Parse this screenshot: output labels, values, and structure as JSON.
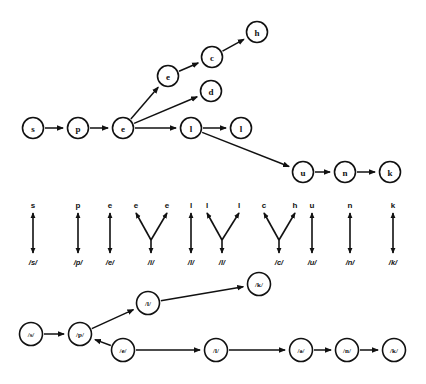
{
  "figure": {
    "background_color": "#ffffff",
    "ink_color": "#111111"
  },
  "letter_graph": {
    "name": "letter-lattice",
    "nodes": [
      {
        "id": "s1",
        "label": "s",
        "x": 33,
        "y": 128
      },
      {
        "id": "p1",
        "label": "p",
        "x": 78,
        "y": 128
      },
      {
        "id": "e1",
        "label": "e",
        "x": 123,
        "y": 128
      },
      {
        "id": "e2",
        "label": "e",
        "x": 168,
        "y": 76
      },
      {
        "id": "c1",
        "label": "c",
        "x": 212,
        "y": 57
      },
      {
        "id": "h1",
        "label": "h",
        "x": 257,
        "y": 32
      },
      {
        "id": "d1",
        "label": "d",
        "x": 211,
        "y": 91
      },
      {
        "id": "l1",
        "label": "l",
        "x": 191,
        "y": 128
      },
      {
        "id": "l2",
        "label": "l",
        "x": 241,
        "y": 128
      },
      {
        "id": "u1",
        "label": "u",
        "x": 303,
        "y": 172
      },
      {
        "id": "n1",
        "label": "n",
        "x": 345,
        "y": 172
      },
      {
        "id": "k1",
        "label": "k",
        "x": 390,
        "y": 172
      }
    ],
    "edges": [
      {
        "from": "s1",
        "to": "p1"
      },
      {
        "from": "p1",
        "to": "e1"
      },
      {
        "from": "e1",
        "to": "e2"
      },
      {
        "from": "e2",
        "to": "c1"
      },
      {
        "from": "c1",
        "to": "h1"
      },
      {
        "from": "e1",
        "to": "d1"
      },
      {
        "from": "e1",
        "to": "l1"
      },
      {
        "from": "l1",
        "to": "l2"
      },
      {
        "from": "l1",
        "to": "u1"
      },
      {
        "from": "u1",
        "to": "n1"
      },
      {
        "from": "n1",
        "to": "k1"
      }
    ]
  },
  "alignment": {
    "name": "grapheme-phoneme-alignment",
    "top_row_y": 205,
    "bottom_row_y": 262,
    "groups": [
      {
        "phoneme": "/s/",
        "phoneme_x": 33,
        "letters": [
          {
            "label": "s",
            "x": 33
          }
        ]
      },
      {
        "phoneme": "/p/",
        "phoneme_x": 78,
        "letters": [
          {
            "label": "p",
            "x": 78
          }
        ]
      },
      {
        "phoneme": "/e/",
        "phoneme_x": 110,
        "letters": [
          {
            "label": "e",
            "x": 110
          }
        ]
      },
      {
        "phoneme": "/i/",
        "phoneme_x": 151,
        "letters": [
          {
            "label": "e",
            "x": 136
          },
          {
            "label": "e",
            "x": 167
          }
        ]
      },
      {
        "phoneme": "/l/",
        "phoneme_x": 191,
        "letters": [
          {
            "label": "l",
            "x": 191
          }
        ]
      },
      {
        "phoneme": "/l/",
        "phoneme_x": 222,
        "letters": [
          {
            "label": "l",
            "x": 207
          },
          {
            "label": "l",
            "x": 239
          }
        ]
      },
      {
        "phoneme": "/c/",
        "phoneme_x": 279,
        "letters": [
          {
            "label": "c",
            "x": 264
          },
          {
            "label": "h",
            "x": 295
          }
        ]
      },
      {
        "phoneme": "/u/",
        "phoneme_x": 312,
        "letters": [
          {
            "label": "u",
            "x": 312
          }
        ]
      },
      {
        "phoneme": "/n/",
        "phoneme_x": 350,
        "letters": [
          {
            "label": "n",
            "x": 350
          }
        ]
      },
      {
        "phoneme": "/k/",
        "phoneme_x": 393,
        "letters": [
          {
            "label": "k",
            "x": 393
          }
        ]
      }
    ]
  },
  "phoneme_graph": {
    "name": "phoneme-lattice",
    "nodes": [
      {
        "id": "ps",
        "label": "/s/",
        "x": 31,
        "y": 334
      },
      {
        "id": "pp",
        "label": "/p/",
        "x": 80,
        "y": 334
      },
      {
        "id": "pl",
        "label": "/l/",
        "x": 148,
        "y": 303
      },
      {
        "id": "pk",
        "label": "/k/",
        "x": 259,
        "y": 284
      },
      {
        "id": "pe",
        "label": "/e/",
        "x": 123,
        "y": 350
      },
      {
        "id": "pl2",
        "label": "/l/",
        "x": 216,
        "y": 350
      },
      {
        "id": "pa",
        "label": "/ə/",
        "x": 301,
        "y": 350
      },
      {
        "id": "pn",
        "label": "/n/",
        "x": 347,
        "y": 350
      },
      {
        "id": "pk2",
        "label": "/k/",
        "x": 394,
        "y": 350
      }
    ],
    "edges": [
      {
        "from": "ps",
        "to": "pp"
      },
      {
        "from": "pp",
        "to": "pl"
      },
      {
        "from": "pl",
        "to": "pk"
      },
      {
        "from": "pe",
        "to": "pp"
      },
      {
        "from": "pe",
        "to": "pl2"
      },
      {
        "from": "pl2",
        "to": "pa"
      },
      {
        "from": "pa",
        "to": "pn"
      },
      {
        "from": "pn",
        "to": "pk2"
      }
    ]
  }
}
